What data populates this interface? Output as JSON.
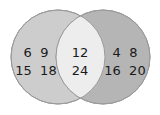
{
  "diagram": {
    "type": "venn",
    "sets": [
      {
        "name": "left",
        "color": "#cdcdcd",
        "only_elements": [
          "6",
          "9",
          "15",
          "18"
        ],
        "rows": [
          "6  9",
          "15  18"
        ]
      },
      {
        "name": "right",
        "color": "#b5b5b5",
        "only_elements": [
          "4",
          "8",
          "16",
          "20"
        ],
        "rows": [
          "4  8",
          "16  20"
        ]
      }
    ],
    "intersection": {
      "color": "#ededed",
      "elements": [
        "12",
        "24"
      ],
      "rows": [
        "12",
        "24"
      ]
    },
    "outline_color": "#9a9a9a"
  }
}
